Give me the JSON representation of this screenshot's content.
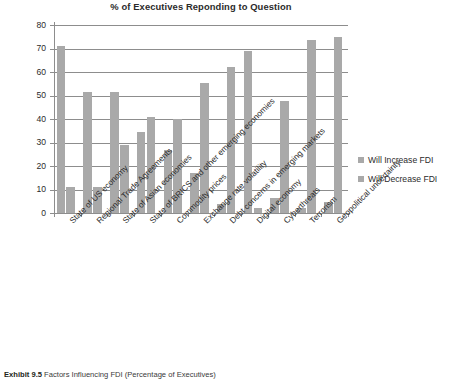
{
  "chart_data": {
    "type": "bar",
    "title": "% of Executives Reponding to Question",
    "xlabel": "",
    "ylabel": "",
    "ylim": [
      0,
      80
    ],
    "yticks": [
      0,
      10,
      20,
      30,
      40,
      50,
      60,
      70,
      80
    ],
    "grid": true,
    "legend_position": "right",
    "categories": [
      "State of US economy",
      "Regional Trade Agreements",
      "State of Asian economies",
      "State of BRICS and other emerging economies",
      "Commodity prices",
      "Exchange rate volatility",
      "Debt concerns in emerging markets",
      "Digital economy",
      "Cyberthreats",
      "Terrorism",
      "Geopolitical uncertainty"
    ],
    "series": [
      {
        "name": "Will Increase FDI",
        "color": "#a9a9a9",
        "values": [
          71,
          51.5,
          51.5,
          34.5,
          27,
          17,
          4,
          69,
          6.5,
          2,
          4.5
        ]
      },
      {
        "name": "Will Decrease FDI",
        "color": "#a9a9a9",
        "values": [
          11,
          11,
          29,
          41,
          40,
          55.5,
          62,
          2,
          47.5,
          73.5,
          75
        ]
      }
    ]
  },
  "caption": {
    "label": "Exhibit 9.5",
    "text": "Factors Influencing FDI (Percentage of Executives)"
  }
}
